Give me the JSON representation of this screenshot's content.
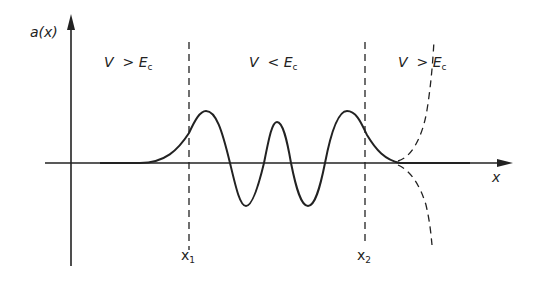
{
  "diagram": {
    "y_axis_label": "a(x)",
    "x_axis_label": "x",
    "regions": [
      {
        "V": "V",
        "op": ">",
        "E": "E",
        "sub": "c"
      },
      {
        "V": "V",
        "op": "<",
        "E": "E",
        "sub": "c"
      },
      {
        "V": "V",
        "op": ">",
        "E": "E",
        "sub": "c"
      }
    ],
    "turning_points": [
      {
        "base": "x",
        "sub": "1"
      },
      {
        "base": "x",
        "sub": "2"
      }
    ],
    "colors": {
      "ink": "#222222",
      "background": "#ffffff"
    }
  }
}
